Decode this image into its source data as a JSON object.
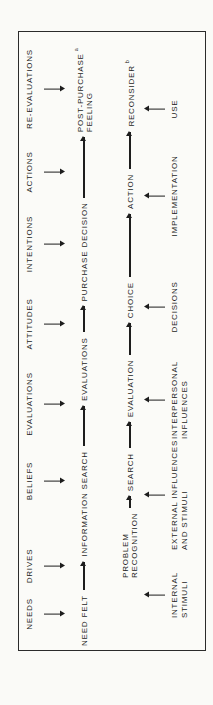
{
  "colors": {
    "ink": "#1d1d1d",
    "paper": "#fbfbf8",
    "page": "#fafaf7"
  },
  "diagram": {
    "row1_labels": [
      "NEEDS",
      "DRIVES",
      "BELIEFS",
      "EVALUATIONS",
      "ATTITUDES",
      "INTENTIONS",
      "ACTIONS",
      "RE-EVALUATIONS"
    ],
    "row2_flow": [
      {
        "label": "NEED FELT"
      },
      {
        "label": "INFORMATION SEARCH"
      },
      {
        "label": "EVALUATIONS"
      },
      {
        "label": "PURCHASE DECISION"
      },
      {
        "lines": [
          "POST-PURCHASE",
          "FEELING"
        ],
        "sup": "a"
      }
    ],
    "row3_flow": [
      {
        "lines": [
          "PROBLEM",
          "RECOGNITION"
        ]
      },
      {
        "label": "SEARCH"
      },
      {
        "label": "EVALUATION"
      },
      {
        "label": "CHOICE"
      },
      {
        "label": "ACTION"
      },
      {
        "label": "RECONSIDER",
        "sup": "b"
      }
    ],
    "row4_labels": [
      {
        "lines": [
          "INTERNAL",
          "STIMULI"
        ]
      },
      {
        "lines": [
          "EXTERNAL INFLUENCES",
          "AND STIMULI"
        ]
      },
      {
        "lines": [
          "INTERPERSONAL",
          "INFLUENCES"
        ]
      },
      {
        "label": "DECISIONS"
      },
      {
        "label": "IMPLEMENTATION"
      },
      {
        "label": "USE"
      }
    ]
  }
}
